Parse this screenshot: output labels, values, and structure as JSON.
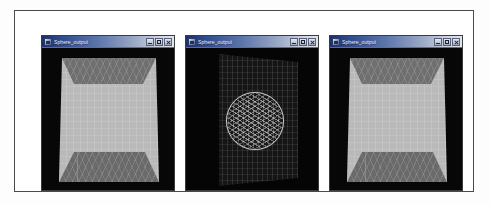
{
  "page": {
    "background_color": "#ffffff",
    "frame_border_color": "#4a4a4a"
  },
  "windows": [
    {
      "id": "window-1",
      "title": "Sphere_output",
      "icon": "app-window-icon",
      "buttons": {
        "minimize": "Minimize",
        "maximize": "Maximize",
        "close": "Close"
      },
      "scene": {
        "type": "shaded-perspective-box",
        "description": "Light gray perspective box interior with darker shaded ceiling and floor trapezoids over a black background",
        "background_color": "#070707",
        "face_color": "#b9b9b9",
        "ceiling_color": "#6f6f6f",
        "floor_color": "#6a6a6a"
      }
    },
    {
      "id": "window-2",
      "title": "Sphere_output",
      "icon": "app-window-icon",
      "buttons": {
        "minimize": "Minimize",
        "maximize": "Maximize",
        "close": "Close"
      },
      "scene": {
        "type": "wireframe-sphere-on-mesh-plane",
        "description": "Dark tilted mesh plane with a light wireframe sphere at its center over a black background",
        "background_color": "#050505",
        "plane_color": "#161616",
        "mesh_color": "#969696",
        "sphere_wire_color": "#c9c9c9"
      }
    },
    {
      "id": "window-3",
      "title": "Sphere_output",
      "icon": "app-window-icon",
      "buttons": {
        "minimize": "Minimize",
        "maximize": "Maximize",
        "close": "Close"
      },
      "scene": {
        "type": "shaded-perspective-box",
        "description": "Light gray perspective box interior with darker shaded ceiling and floor trapezoids over a black background",
        "background_color": "#070707",
        "face_color": "#b9b9b9",
        "ceiling_color": "#6f6f6f",
        "floor_color": "#6a6a6a"
      }
    }
  ]
}
